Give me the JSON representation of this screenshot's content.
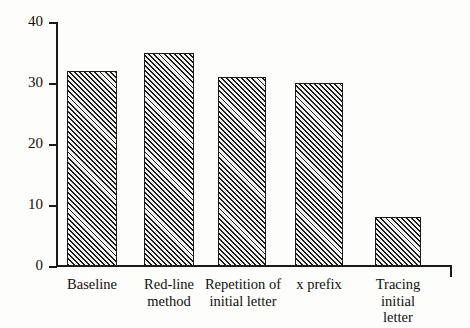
{
  "chart_data": {
    "type": "bar",
    "title": "",
    "subtitle": "",
    "xlabel": "",
    "ylabel": "",
    "categories": [
      "Baseline",
      "Red-line\nmethod",
      "Repetition of\ninitial letter",
      "x prefix",
      "Tracing\ninitial\nletter"
    ],
    "values": [
      32,
      35,
      31,
      30,
      8
    ],
    "ylim": [
      0,
      40
    ],
    "ytick_labels": [
      "0",
      "10",
      "20",
      "30",
      "40"
    ],
    "ytick_values": [
      0,
      10,
      20,
      30,
      40
    ],
    "grid": false,
    "legend": null,
    "bar_fill": "hatched-diagonal",
    "bar_edge_color": "#1a1a1a",
    "background_color": "#fdfdfb"
  },
  "bars": [
    {
      "label": "Baseline",
      "value": 32,
      "left": 67,
      "width": 50
    },
    {
      "label": "Red-line\nmethod",
      "value": 35,
      "left": 144,
      "width": 50
    },
    {
      "label": "Repetition of\ninitial letter",
      "value": 31,
      "left": 218,
      "width": 48
    },
    {
      "label": "x prefix",
      "value": 30,
      "left": 295,
      "width": 48
    },
    {
      "label": "Tracing\ninitial\nletter",
      "value": 8,
      "left": 375,
      "width": 46
    }
  ],
  "label_boxes": [
    {
      "text": "Baseline",
      "left": 52,
      "width": 80
    },
    {
      "text": "Red-line\nmethod",
      "left": 129,
      "width": 80
    },
    {
      "text": "Repetition of\ninitial letter",
      "left": 198,
      "width": 90
    },
    {
      "text": "x prefix",
      "left": 282,
      "width": 74
    },
    {
      "text": "Tracing\ninitial\nletter",
      "left": 360,
      "width": 76
    }
  ],
  "y_ticks": [
    {
      "label": "40",
      "value": 40,
      "top": 22
    },
    {
      "label": "30",
      "value": 30,
      "top": 83
    },
    {
      "label": "20",
      "value": 20,
      "top": 144
    },
    {
      "label": "10",
      "value": 10,
      "top": 205
    },
    {
      "label": "0",
      "value": 0,
      "top": 266
    }
  ]
}
